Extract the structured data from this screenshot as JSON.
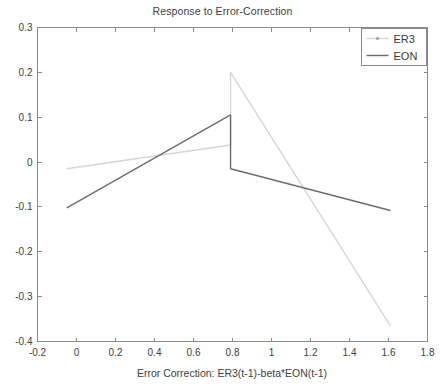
{
  "chart_data": {
    "type": "line",
    "title": "Response to Error-Correction",
    "xlabel": "Error Correction: ER3(t-1)-beta*EON(t-1)",
    "ylabel": "",
    "xlim": [
      -0.2,
      1.8
    ],
    "ylim": [
      -0.4,
      0.3
    ],
    "xticks": [
      "-0.2",
      "0",
      "0.2",
      "0.4",
      "0.6",
      "0.8",
      "1",
      "1.2",
      "1.4",
      "1.6",
      "1.8"
    ],
    "xtick_values": [
      -0.2,
      0,
      0.2,
      0.4,
      0.6,
      0.8,
      1.0,
      1.2,
      1.4,
      1.6,
      1.8
    ],
    "yticks": [
      "0.3",
      "0.2",
      "0.1",
      "0",
      "-0.1",
      "-0.2",
      "-0.3",
      "-0.4"
    ],
    "ytick_values": [
      0.3,
      0.2,
      0.1,
      0,
      -0.1,
      -0.2,
      -0.3,
      -0.4
    ],
    "grid": false,
    "legend_position": "top-right",
    "threshold_x": 0.79,
    "series": [
      {
        "name": "ER3",
        "color": "#d6d6d6",
        "style": "line-with-marker",
        "segments": [
          [
            [
              -0.05,
              -0.015
            ],
            [
              0.79,
              0.038
            ]
          ],
          [
            [
              0.79,
              0.2
            ],
            [
              1.61,
              -0.365
            ]
          ]
        ]
      },
      {
        "name": "EON",
        "color": "#6c6c6c",
        "style": "solid",
        "segments": [
          [
            [
              -0.05,
              -0.102
            ],
            [
              0.79,
              0.105
            ]
          ],
          [
            [
              0.79,
              -0.015
            ],
            [
              1.61,
              -0.108
            ]
          ]
        ]
      }
    ],
    "legend": [
      {
        "label": "ER3",
        "color": "#d6d6d6",
        "marker": true
      },
      {
        "label": "EON",
        "color": "#6c6c6c",
        "marker": false
      }
    ]
  }
}
